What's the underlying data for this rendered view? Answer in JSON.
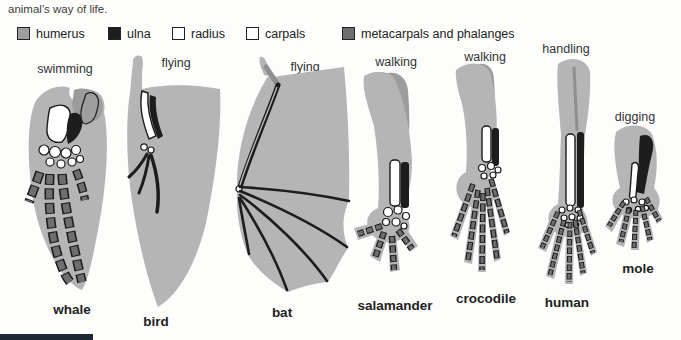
{
  "caption": "animal's way of life.",
  "colors": {
    "paper": "#fdfdfc",
    "silhouette": "#b5b5b5",
    "silhouette_dark": "#9c9c9c",
    "humerus": "#9e9e9e",
    "ulna": "#1d1d1d",
    "radius": "#ffffff",
    "carpals": "#ffffff",
    "metacarpals": "#6e6e6e",
    "outline": "#1a1a1a",
    "text": "#2e2e2e",
    "page_edge": "#1c2834"
  },
  "legend": {
    "items": [
      {
        "label": "humerus",
        "swatch": "humerus"
      },
      {
        "label": "ulna",
        "swatch": "ulna"
      },
      {
        "label": "radius",
        "swatch": "radius"
      },
      {
        "label": "carpals",
        "swatch": "carpals"
      },
      {
        "label": "metacarpals and phalanges",
        "swatch": "metacarpals"
      }
    ]
  },
  "specimens": [
    {
      "name": "whale",
      "activity": "swimming"
    },
    {
      "name": "bird",
      "activity": "flying"
    },
    {
      "name": "bat",
      "activity": "flying"
    },
    {
      "name": "salamander",
      "activity": "walking"
    },
    {
      "name": "crocodile",
      "activity": "walking"
    },
    {
      "name": "human",
      "activity": "handling"
    },
    {
      "name": "mole",
      "activity": "digging"
    }
  ]
}
